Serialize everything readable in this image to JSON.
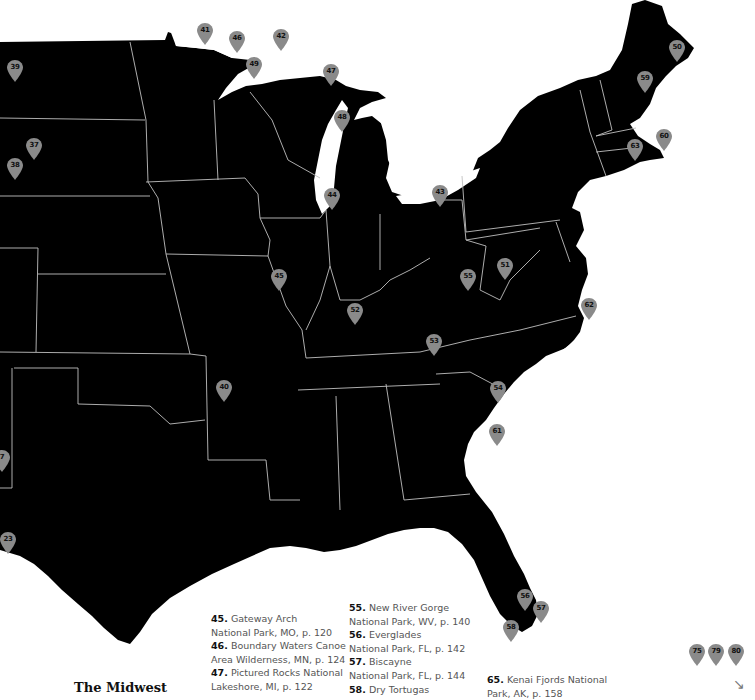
{
  "map": {
    "background_color": "#ffffff",
    "land_color": "#000000",
    "border_color": "#bfbfbf",
    "pin_color": "#8a8a8a",
    "pins": [
      {
        "id": "41",
        "x": 205,
        "y": 45
      },
      {
        "id": "46",
        "x": 237,
        "y": 53
      },
      {
        "id": "42",
        "x": 281,
        "y": 51
      },
      {
        "id": "49",
        "x": 254,
        "y": 79
      },
      {
        "id": "47",
        "x": 331,
        "y": 86
      },
      {
        "id": "48",
        "x": 342,
        "y": 132
      },
      {
        "id": "39",
        "x": 15,
        "y": 82
      },
      {
        "id": "37",
        "x": 34,
        "y": 160
      },
      {
        "id": "38",
        "x": 15,
        "y": 180
      },
      {
        "id": "44",
        "x": 332,
        "y": 210
      },
      {
        "id": "43",
        "x": 440,
        "y": 207
      },
      {
        "id": "45",
        "x": 279,
        "y": 291
      },
      {
        "id": "52",
        "x": 355,
        "y": 325
      },
      {
        "id": "55",
        "x": 468,
        "y": 291
      },
      {
        "id": "51",
        "x": 505,
        "y": 280
      },
      {
        "id": "62",
        "x": 589,
        "y": 320
      },
      {
        "id": "53",
        "x": 434,
        "y": 356
      },
      {
        "id": "40",
        "x": 224,
        "y": 402
      },
      {
        "id": "54",
        "x": 498,
        "y": 403
      },
      {
        "id": "61",
        "x": 497,
        "y": 446
      },
      {
        "id": "50",
        "x": 677,
        "y": 62
      },
      {
        "id": "59",
        "x": 645,
        "y": 93
      },
      {
        "id": "60",
        "x": 664,
        "y": 151
      },
      {
        "id": "63",
        "x": 635,
        "y": 161
      },
      {
        "id": "7",
        "x": 2,
        "y": 472
      },
      {
        "id": "23",
        "x": 8,
        "y": 554
      },
      {
        "id": "56",
        "x": 525,
        "y": 611
      },
      {
        "id": "57",
        "x": 541,
        "y": 623
      },
      {
        "id": "58",
        "x": 511,
        "y": 642
      },
      {
        "id": "75",
        "x": 697,
        "y": 666
      },
      {
        "id": "79",
        "x": 716,
        "y": 666
      },
      {
        "id": "80",
        "x": 736,
        "y": 666
      }
    ]
  },
  "section_title": "The Midwest",
  "legend": {
    "col1": [
      {
        "num": "45.",
        "name": "Gateway Arch",
        "loc": "National Park, MO, p. 120"
      },
      {
        "num": "46.",
        "name": "Boundary Waters Canoe",
        "loc": "Area Wilderness, MN, p. 124"
      },
      {
        "num": "47.",
        "name": "Pictured Rocks National",
        "loc": "Lakeshore, MI, p. 122"
      }
    ],
    "col2": [
      {
        "num": "55.",
        "name": "New River Gorge",
        "loc": "National Park, WV, p. 140"
      },
      {
        "num": "56.",
        "name": "Everglades",
        "loc": "National Park, FL, p. 142"
      },
      {
        "num": "57.",
        "name": "Biscayne",
        "loc": "National Park, FL, p. 144"
      },
      {
        "num": "58.",
        "name": "Dry Tortugas",
        "loc": ""
      }
    ],
    "col3": [
      {
        "num": "65.",
        "name": "Kenai Fjords National",
        "loc": "Park, AK, p. 158"
      }
    ]
  },
  "next_arrow": "↘"
}
